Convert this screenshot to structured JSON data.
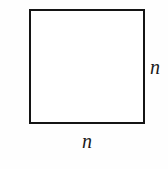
{
  "figure": {
    "name": "square-with-side-labels",
    "background_color": "#fefefe",
    "shape": {
      "type": "square",
      "stroke_color": "#141414",
      "stroke_width_px": 2,
      "fill_color": "#ffffff"
    },
    "labels": {
      "right_side": "n",
      "bottom_side": "n"
    }
  },
  "chart_data": {
    "type": "diagram",
    "title": "",
    "shape": "square",
    "side_length_symbol": "n",
    "annotations": [
      {
        "position": "right",
        "text": "n"
      },
      {
        "position": "bottom",
        "text": "n"
      }
    ]
  }
}
